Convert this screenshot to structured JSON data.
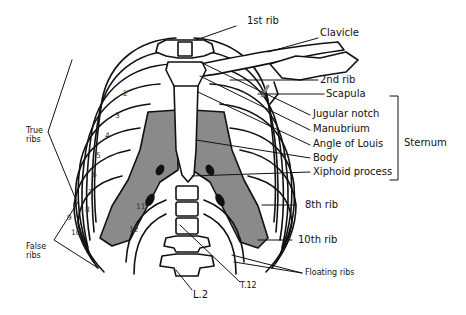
{
  "diagram": {
    "colors": {
      "stroke": "#111111",
      "cartilage": "#8a8a8a",
      "bone": "#ffffff",
      "background": "#ffffff"
    },
    "labels_right": {
      "first_rib": "1st rib",
      "clavicle": "Clavicle",
      "second_rib": "2nd rib",
      "scapula": "Scapula",
      "jugular_notch": "Jugular notch",
      "manubrium": "Manubrium",
      "angle_of_louis": "Angle of Louis",
      "body": "Body",
      "xiphoid_process": "Xiphoid process",
      "sternum": "Sternum",
      "eighth_rib": "8th rib",
      "tenth_rib": "10th rib",
      "floating_ribs": "Floating ribs"
    },
    "labels_left": {
      "true_ribs_line1": "True",
      "true_ribs_line2": "ribs",
      "false_ribs_line1": "False",
      "false_ribs_line2": "ribs"
    },
    "labels_bottom": {
      "l2": "L.2",
      "t12": "T.12"
    },
    "rib_numbers": [
      "2",
      "3",
      "4",
      "5",
      "6",
      "7",
      "8",
      "9",
      "10",
      "11",
      "12"
    ]
  }
}
